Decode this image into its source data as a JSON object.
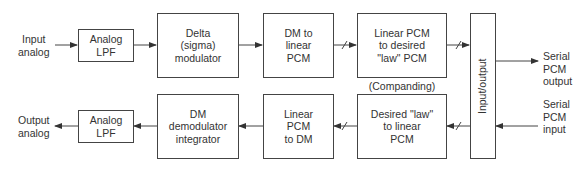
{
  "diagram": {
    "top_row": {
      "input_label": "Input\nanalog",
      "lpf": "Analog\nLPF",
      "modulator": "Delta\n(sigma)\nmodulator",
      "dm_to_linear": "DM to\nlinear\nPCM",
      "linear_to_law": "Linear PCM\nto desired\n\"law\" PCM"
    },
    "companding_label": "(Companding)",
    "io_block": "Input/output",
    "serial_output_label": "Serial\nPCM\noutput",
    "serial_input_label": "Serial\nPCM\ninput",
    "bottom_row": {
      "output_label": "Output\nanalog",
      "lpf": "Analog\nLPF",
      "demodulator": "DM\ndemodulator\nintegrator",
      "linear_to_dm": "Linear\nPCM\nto DM",
      "law_to_linear": "Desired \"law\"\nto linear\nPCM"
    },
    "colors": {
      "line": "#444444",
      "text": "#333333"
    }
  }
}
